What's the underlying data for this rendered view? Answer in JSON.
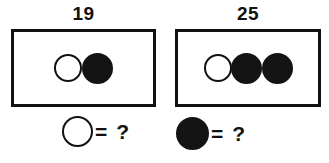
{
  "puzzle": {
    "groups": [
      {
        "name": "group-left",
        "total": "19",
        "box": {
          "left": 11,
          "top": 29,
          "width": 145,
          "height": 78
        },
        "label_top": 4,
        "circles": [
          {
            "type": "white-circle",
            "size": 28,
            "overlap": -4
          },
          {
            "type": "black-circle",
            "size": 31,
            "overlap": 0
          }
        ]
      },
      {
        "name": "group-right",
        "total": "25",
        "box": {
          "left": 175,
          "top": 29,
          "width": 146,
          "height": 78
        },
        "label_top": 4,
        "circles": [
          {
            "type": "white-circle",
            "size": 28,
            "overlap": -3
          },
          {
            "type": "black-circle",
            "size": 31,
            "overlap": -1
          },
          {
            "type": "black-circle",
            "size": 31,
            "overlap": 0
          }
        ]
      }
    ],
    "legends": [
      {
        "name": "legend-white-circle",
        "circle_type": "white-circle",
        "circle_size": 31,
        "equals": "=",
        "question": "?",
        "left": 62,
        "top": 116
      },
      {
        "name": "legend-black-circle",
        "circle_type": "black-circle",
        "circle_size": 33,
        "equals": "=",
        "question": "?",
        "left": 176,
        "top": 117
      }
    ],
    "colors": {
      "ink": "#111111",
      "fill": "#141414",
      "background": "#ffffff"
    }
  },
  "chart_data": {
    "type": "table",
    "title": "",
    "categories": [
      "19",
      "25"
    ],
    "values": [
      19,
      25
    ],
    "series": [
      {
        "name": "group-left",
        "total": 19,
        "white_circles": 1,
        "black_circles": 1
      },
      {
        "name": "group-right",
        "total": 25,
        "white_circles": 1,
        "black_circles": 2
      }
    ],
    "legend_entries": [
      "white-circle = ?",
      "black-circle = ?"
    ],
    "xlabel": "",
    "ylabel": ""
  }
}
